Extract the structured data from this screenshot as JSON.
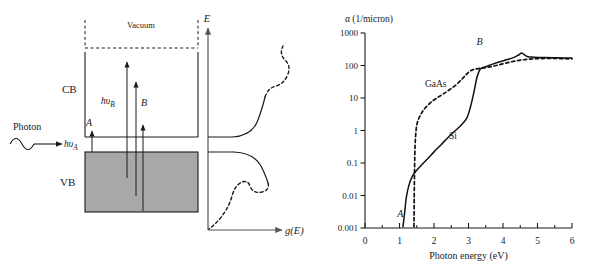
{
  "figure": {
    "left_panel": {
      "name": "band-diagram",
      "labels": {
        "vacuum": "Vacuum",
        "conduction_band": "CB",
        "valence_band": "VB",
        "photon": "Photon",
        "hv_a": "hυ",
        "hv_a_sub": "A",
        "hv_b": "hυ",
        "hv_b_sub": "B",
        "transition_a": "A",
        "transition_b": "B",
        "energy_axis": "E",
        "dos_axis": "g(E)"
      },
      "colors": {
        "valence_band_fill": "#a8a8a8",
        "line": "#1a1a1a",
        "axis": "#555555"
      }
    },
    "right_panel": {
      "name": "absorption-coefficient-chart"
    }
  },
  "chart_data": {
    "type": "line",
    "title": "",
    "xlabel": "Photon energy (eV)",
    "ylabel": "α  (1/micron)",
    "yscale": "log",
    "xlim": [
      0,
      6
    ],
    "ylim": [
      0.001,
      1000
    ],
    "xticks": [
      0,
      1,
      2,
      3,
      4,
      5,
      6
    ],
    "xtick_labels": [
      "0",
      "1",
      "2",
      "3",
      "4",
      "5",
      "6"
    ],
    "xminor_step": 0.5,
    "yticks": [
      0.001,
      0.01,
      0.1,
      1,
      10,
      100,
      1000
    ],
    "ytick_labels": [
      "0.001",
      "0.01",
      "0.1",
      "1",
      "10",
      "100",
      "1000"
    ],
    "grid": false,
    "legend": "inline-annotations",
    "annotations": [
      {
        "text": "GaAs",
        "x": 2.05,
        "y": 22,
        "style": "upright"
      },
      {
        "text": "Si",
        "x": 2.55,
        "y": 0.55,
        "style": "upright"
      },
      {
        "text": "A",
        "x": 1.02,
        "y": 0.0022,
        "style": "italic"
      },
      {
        "text": "B",
        "x": 3.32,
        "y": 430,
        "style": "italic"
      }
    ],
    "series": [
      {
        "name": "Si",
        "style": "solid",
        "color": "#111111",
        "x": [
          1.1,
          1.15,
          1.2,
          1.28,
          1.38,
          1.5,
          1.65,
          1.8,
          2.0,
          2.2,
          2.4,
          2.6,
          2.8,
          2.95,
          3.05,
          3.15,
          3.25,
          3.35,
          3.5,
          3.7,
          3.9,
          4.1,
          4.3,
          4.45,
          4.55,
          4.7,
          4.9,
          5.2,
          5.6,
          6.0
        ],
        "y": [
          0.0011,
          0.003,
          0.009,
          0.022,
          0.04,
          0.06,
          0.09,
          0.13,
          0.22,
          0.36,
          0.6,
          0.95,
          1.5,
          2.4,
          5.0,
          14,
          45,
          80,
          92,
          110,
          130,
          150,
          175,
          210,
          240,
          190,
          180,
          175,
          172,
          170
        ]
      },
      {
        "name": "GaAs",
        "style": "dashed",
        "color": "#111111",
        "x": [
          1.42,
          1.43,
          1.45,
          1.48,
          1.52,
          1.58,
          1.65,
          1.75,
          1.9,
          2.05,
          2.25,
          2.45,
          2.65,
          2.85,
          3.0,
          3.1,
          3.2,
          3.35,
          3.55,
          3.8,
          4.1,
          4.4,
          4.7,
          5.0,
          5.4,
          5.8,
          6.0
        ],
        "y": [
          0.0011,
          0.02,
          0.3,
          1.0,
          1.8,
          2.6,
          3.6,
          5.0,
          7.2,
          9.5,
          13,
          18,
          26,
          42,
          62,
          72,
          78,
          82,
          88,
          100,
          120,
          140,
          155,
          162,
          165,
          162,
          160
        ]
      }
    ]
  }
}
